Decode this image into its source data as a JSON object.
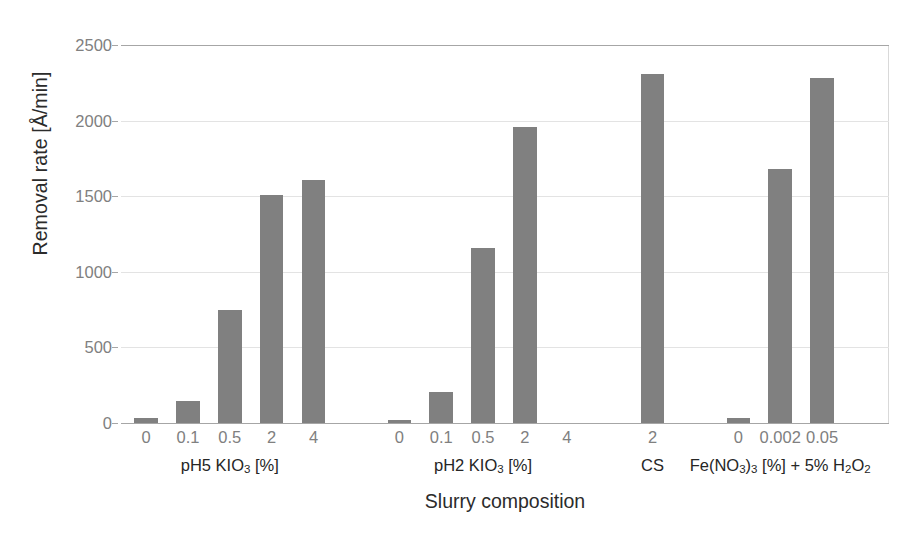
{
  "chart_data": {
    "type": "bar",
    "title": "",
    "xlabel": "Slurry composition",
    "ylabel": "Removal rate [Å/min]",
    "ylim": [
      0,
      2500
    ],
    "ytick_labels": [
      "0",
      "500",
      "1000",
      "1500",
      "2000",
      "2500"
    ],
    "yticks": [
      0,
      500,
      1000,
      1500,
      2000,
      2500
    ],
    "grid": true,
    "legend": "none",
    "bar_color": "#808080",
    "groups": [
      {
        "label": "pH5 KIO3 [%]",
        "label_html": "pH5 KIO<sub>3</sub> [%]",
        "categories": [
          "0",
          "0.1",
          "0.5",
          "2",
          "4"
        ],
        "values": [
          35,
          145,
          750,
          1510,
          1605
        ]
      },
      {
        "label": "pH2 KIO3 [%]",
        "label_html": "pH2 KIO<sub>3</sub> [%]",
        "categories": [
          "0",
          "0.1",
          "0.5",
          "2",
          "4"
        ],
        "values": [
          22,
          205,
          1160,
          1955,
          null
        ]
      },
      {
        "label": "CS",
        "label_html": "CS",
        "categories": [
          "2"
        ],
        "values": [
          2305
        ]
      },
      {
        "label": "Fe(NO3)3 [%] + 5% H2O2",
        "label_html": "Fe(NO<sub>3</sub>)<sub>3</sub> [%] + 5% H<sub>2</sub>O<sub>2</sub>",
        "categories": [
          "0",
          "0.002",
          "0.05"
        ],
        "values": [
          35,
          1680,
          2285
        ]
      }
    ]
  }
}
